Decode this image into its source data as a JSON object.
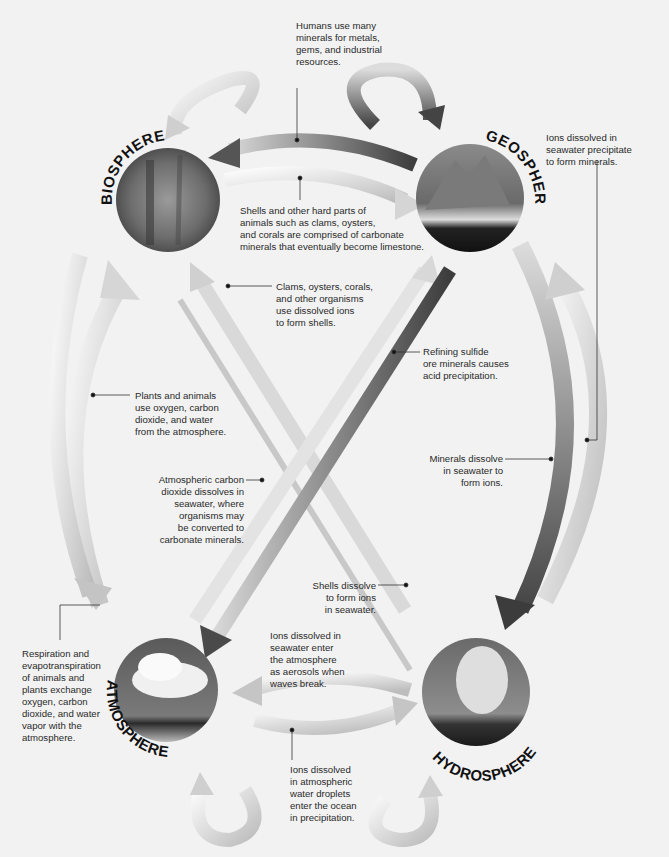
{
  "spheres": {
    "biosphere": {
      "label": "BIOSPHERE",
      "image": "forest-photo"
    },
    "geosphere": {
      "label": "GEOSPHERE",
      "image": "mountain-photo"
    },
    "atmosphere": {
      "label": "ATMOSPHERE",
      "image": "cloud-photo"
    },
    "hydrosphere": {
      "label": "HYDROSPHERE",
      "image": "geyser-steam-photo"
    }
  },
  "annotations": {
    "humans_minerals": "Humans use many\nminerals for metals,\ngems, and industrial\nresources.",
    "ions_precipitate": "Ions dissolved in\nseawater precipitate\nto form minerals.",
    "shells_limestone": "Shells and other hard parts of\nanimals such as clams, oysters,\nand corals are comprised of carbonate\nminerals that eventually become limestone.",
    "clams_shells": "Clams, oysters, corals,\nand other organisms\nuse dissolved ions\nto form shells.",
    "refining_sulfide": "Refining sulfide\nore minerals causes\nacid precipitation.",
    "plants_animals": "Plants and animals\nuse oxygen, carbon\ndioxide, and water\nfrom the atmosphere.",
    "minerals_dissolve": "Minerals dissolve\nin seawater to\nform ions.",
    "carbon_dissolves": "Atmospheric carbon\ndioxide dissolves in\nseawater, where\norganisms may\nbe converted to\ncarbonate minerals.",
    "shells_dissolve": "Shells dissolve\nto form ions\nin seawater.",
    "ions_aerosols": "Ions dissolved in\nseawater enter\nthe atmosphere\nas aerosols when\nwaves break.",
    "respiration": "Respiration and\nevapotranspiration\nof animals and\nplants exchange\noxygen, carbon\ndioxide, and water\nvapor with the\natmosphere.",
    "ions_droplets": "Ions dissolved\nin atmospheric\nwater droplets\nenter the ocean\nin precipitation."
  },
  "colors": {
    "background": "#f2f2f2",
    "arrow_light": "#e6e6e6",
    "arrow_mid": "#b5b5b5",
    "arrow_dark": "#555555",
    "text": "#2a2a2a"
  }
}
